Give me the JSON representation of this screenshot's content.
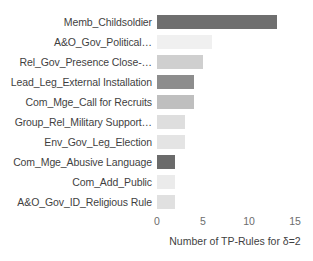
{
  "chart_data": {
    "type": "bar",
    "orientation": "horizontal",
    "title": "",
    "subtitle": "",
    "xlabel": "Number of TP-Rules for δ=2",
    "ylabel": "",
    "xlim": [
      0,
      15
    ],
    "xticks": [
      0,
      5,
      10,
      15
    ],
    "xtick_labels": [
      "0",
      "5",
      "10",
      "15"
    ],
    "grid": false,
    "legend": false,
    "categories": [
      "Memb_Childsoldier",
      "A&O_Gov_Political…",
      "Rel_Gov_Presence Close-…",
      "Lead_Leg_External Installation",
      "Com_Mge_Call for Recruits",
      "Group_Rel_Military Support…",
      "Env_Gov_Leg_Election",
      "Com_Mge_Abusive Language",
      "Com_Add_Public",
      "A&O_Gov_ID_Religious Rule"
    ],
    "values": [
      13,
      6,
      5,
      4,
      4,
      3,
      3,
      2,
      2,
      2
    ],
    "bar_colors": [
      "#6f6f6f",
      "#f0f0f0",
      "#cfcfcf",
      "#8d8d8d",
      "#bfbfbf",
      "#dedede",
      "#e4e4e4",
      "#6b6b6b",
      "#ebebeb",
      "#e0e0e0"
    ],
    "bars": [
      {
        "label": "Memb_Childsoldier",
        "value": 13,
        "color": "#6f6f6f"
      },
      {
        "label": "A&O_Gov_Political…",
        "value": 6,
        "color": "#f0f0f0"
      },
      {
        "label": "Rel_Gov_Presence Close-…",
        "value": 5,
        "color": "#cfcfcf"
      },
      {
        "label": "Lead_Leg_External Installation",
        "value": 4,
        "color": "#8d8d8d"
      },
      {
        "label": "Com_Mge_Call for Recruits",
        "value": 4,
        "color": "#bfbfbf"
      },
      {
        "label": "Group_Rel_Military Support…",
        "value": 3,
        "color": "#dedede"
      },
      {
        "label": "Env_Gov_Leg_Election",
        "value": 3,
        "color": "#e4e4e4"
      },
      {
        "label": "Com_Mge_Abusive Language",
        "value": 2,
        "color": "#6b6b6b"
      },
      {
        "label": "Com_Add_Public",
        "value": 2,
        "color": "#ebebeb"
      },
      {
        "label": "A&O_Gov_ID_Religious Rule",
        "value": 2,
        "color": "#e0e0e0"
      }
    ]
  },
  "colors": {
    "background": "#ffffff",
    "label_text": "#3f3f3f",
    "tick_text": "#6d6d6d"
  }
}
